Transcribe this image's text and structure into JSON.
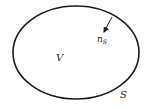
{
  "diagram": {
    "boundary": {
      "label": "S",
      "stroke": "#1a1a1a"
    },
    "volume": {
      "label": "V"
    },
    "normal": {
      "label": "n",
      "subscript": "S"
    }
  }
}
